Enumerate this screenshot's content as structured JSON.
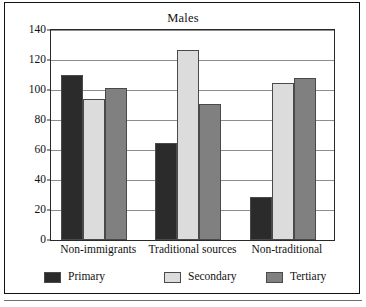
{
  "chart_data": {
    "type": "bar",
    "title": "Males",
    "xlabel": "",
    "ylabel": "",
    "categories": [
      "Non-immigrants",
      "Traditional sources",
      "Non-traditional"
    ],
    "series": [
      {
        "name": "Primary",
        "values": [
          110,
          65,
          29
        ],
        "color": "#2b2b2b"
      },
      {
        "name": "Secondary",
        "values": [
          94,
          126.5,
          105
        ],
        "color": "#dcdcdc"
      },
      {
        "name": "Tertiary",
        "values": [
          101.5,
          90.5,
          108
        ],
        "color": "#808080"
      }
    ],
    "ylim": [
      0,
      140
    ],
    "yticks": [
      0,
      20,
      40,
      60,
      80,
      100,
      120,
      140
    ],
    "ytick_labels": [
      "0",
      "20",
      "40",
      "60",
      "80",
      "100",
      "120",
      "140"
    ],
    "grid": true,
    "legend_position": "bottom"
  },
  "legend": {
    "items": [
      {
        "label": "Primary"
      },
      {
        "label": "Secondary"
      },
      {
        "label": "Tertiary"
      }
    ]
  }
}
